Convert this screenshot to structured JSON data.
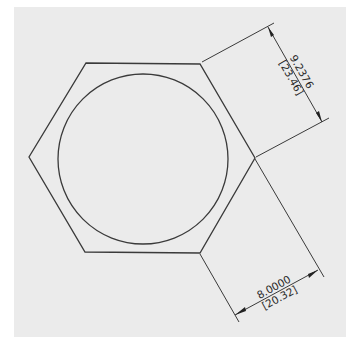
{
  "drawing": {
    "type": "technical-drawing",
    "subject": "hexagon with inscribed circle",
    "colors": {
      "paper": "#ebebeb",
      "line": "#3a3a3a",
      "background": "#ffffff"
    },
    "dimensions": [
      {
        "id": "across-corners",
        "value": "9.2376",
        "metric": "[23.46]"
      },
      {
        "id": "across-flats",
        "value": "8.0000",
        "metric": "[20.32]"
      }
    ]
  }
}
